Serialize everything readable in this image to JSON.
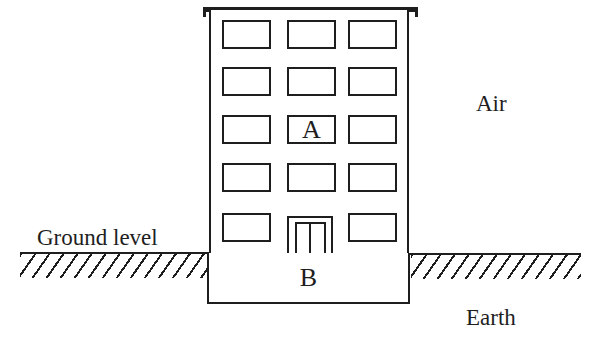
{
  "diagram": {
    "labels": {
      "ground_level": "Ground level",
      "air": "Air",
      "earth": "Earth",
      "point_a": "A",
      "point_b": "B"
    },
    "colors": {
      "ink": "#1e1e1e",
      "background": "#ffffff"
    },
    "building": {
      "window_rows": 5,
      "window_columns": 3,
      "door_position": "bottom-center"
    }
  }
}
